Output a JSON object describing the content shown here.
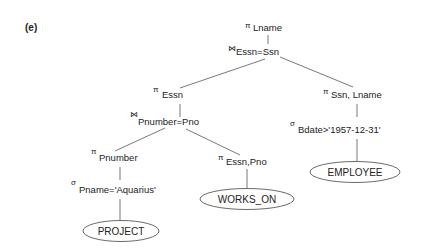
{
  "figure": {
    "label": "(e)",
    "nodes": {
      "root_project": {
        "operator": "π",
        "subscript": "Lname"
      },
      "root_join": {
        "operator": "⋈",
        "subscript": "Essn=Ssn"
      },
      "left_project": {
        "operator": "π",
        "subscript": "Essn"
      },
      "left_join": {
        "operator": "⋈",
        "subscript": "Pnumber=Pno"
      },
      "project_pnumber": {
        "operator": "π",
        "subscript": "Pnumber"
      },
      "select_pname": {
        "operator": "σ",
        "subscript": "Pname='Aquarius'"
      },
      "project_essn_pno": {
        "operator": "π",
        "subscript": "Essn,Pno"
      },
      "right_project": {
        "operator": "π",
        "subscript": "Ssn, Lname"
      },
      "select_bdate": {
        "operator": "σ",
        "subscript": "Bdate>'1957-12-31'"
      }
    },
    "relations": {
      "project": "PROJECT",
      "works_on": "WORKS_ON",
      "employee": "EMPLOYEE"
    },
    "colors": {
      "text": "#222222",
      "edge": "#555555",
      "background": "#ffffff"
    }
  }
}
